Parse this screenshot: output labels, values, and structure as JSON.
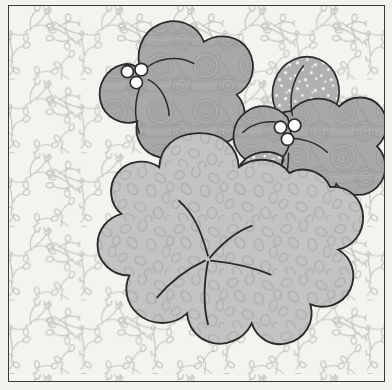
{
  "artwork": {
    "title": "Floral Applique Quilt Block",
    "kind": "line-art illustration",
    "frame": {
      "border_color": "#3a3a3a",
      "border_width_px": 1.6,
      "background_color": "#f4f4f1"
    },
    "palette": {
      "background_fabric": "#f3f3f0",
      "background_vine": "#c9c9c4",
      "petal_swirl_fill": "#a8a8a8",
      "petal_dotted_fill": "#b0b0b0",
      "petal_dot_color": "#ffffff",
      "leaf_fill": "#c2c2c0",
      "leaf_pebble_color": "#aeaeac",
      "outline_color": "#2b2b2b",
      "center_circle_fill": "#fdfdfb",
      "vein_color": "#2b2b2b"
    },
    "elements": [
      {
        "name": "background-fabric",
        "description": "Very light gray ground printed with a scattered vine-and-teardrop-leaf sprig motif",
        "motif": "vine sprigs with teardrop leaves"
      },
      {
        "name": "large-scalloped-leaf",
        "description": "Large rounded scalloped plant form filling the lower two thirds, printed with a mottled pebble texture",
        "lobe_count": 9,
        "texture": "pebble / mottled"
      },
      {
        "name": "leaf-veins",
        "description": "Five hand-drawn curved vein lines radiating from a single point near the leaf center",
        "count": 5
      },
      {
        "name": "flower-left",
        "description": "Five-petal blossom in the upper left; four petals printed with a fine swirl texture and one lower-right petal printed with white dots",
        "petal_count": 5,
        "center": "three white circles"
      },
      {
        "name": "flower-right",
        "description": "Five-petal blossom in the upper right; petals alternate swirl-texture and white-dot prints",
        "petal_count": 5,
        "center": "three white circles"
      },
      {
        "name": "flower-center-beads",
        "description": "Cluster of three small white outlined circles marking each flower center",
        "count_per_flower": 3
      }
    ]
  }
}
